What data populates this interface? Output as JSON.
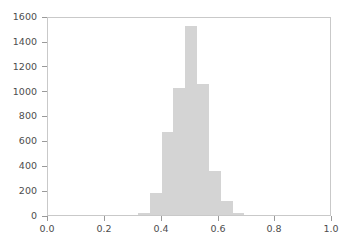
{
  "chart_data": {
    "type": "bar",
    "subtype": "histogram",
    "title": "",
    "xlabel": "",
    "ylabel": "",
    "xlim": [
      0.0,
      1.0
    ],
    "ylim": [
      0,
      1600
    ],
    "grid": false,
    "legend": null,
    "bar_color": "#d4d4d4",
    "axes_color": "#c9c9c9",
    "tick_color": "#9a9a9a",
    "label_color": "#4d4d4d",
    "background": "#ffffff",
    "xticks": [
      0.0,
      0.2,
      0.4,
      0.6,
      0.8,
      1.0
    ],
    "xtick_labels": [
      "0.0",
      "0.2",
      "0.4",
      "0.6",
      "0.8",
      "1.0"
    ],
    "yticks": [
      0,
      200,
      400,
      600,
      800,
      1000,
      1200,
      1400,
      1600
    ],
    "ytick_labels": [
      "0",
      "200",
      "400",
      "600",
      "800",
      "1000",
      "1200",
      "1400",
      "1600"
    ],
    "bin_width": 0.0417,
    "bin_edges": [
      0.3167,
      0.3583,
      0.4,
      0.4417,
      0.4833,
      0.525,
      0.5667,
      0.6083,
      0.65,
      0.6917
    ],
    "bin_centers": [
      0.3375,
      0.3792,
      0.4208,
      0.4625,
      0.5042,
      0.5458,
      0.5875,
      0.6292,
      0.6708
    ],
    "values": [
      15,
      180,
      670,
      1025,
      1520,
      1050,
      350,
      115,
      15
    ]
  }
}
